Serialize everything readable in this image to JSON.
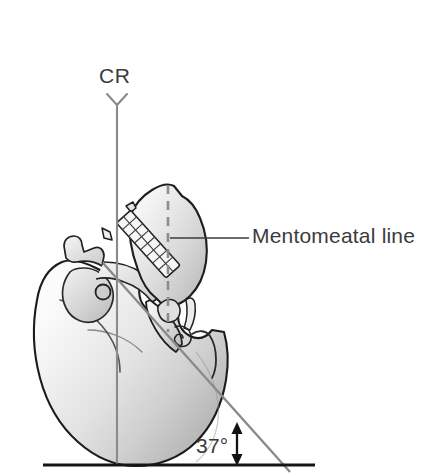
{
  "figure": {
    "name": "lateral-skull-mentomeatal-positioning-diagram",
    "labels": {
      "central_ray": "CR",
      "mentomeatal_line": "Mentomeatal line",
      "angle": "37°"
    },
    "icons": {
      "cr_arrow": "arrowhead-down-icon",
      "angle_arrow": "double-headed-arrow-icon",
      "leader_line": "leader-line-icon",
      "dashed_reference": "dashed-vertical-reference-icon"
    },
    "colors": {
      "background": "#ffffff",
      "outline": "#1a1a1a",
      "text": "#3b3b3b",
      "line_gray": "#7a7a7a",
      "baseline": "#1a1a1a",
      "dashed_gray": "#8c8c8c",
      "bone_light": "#f2f2f2",
      "bone_mid": "#d8d8d8",
      "bone_dark": "#a8a8a8",
      "tooth_fill": "#fbfbfb"
    },
    "geometry": {
      "cr_line": {
        "x": 117,
        "y_top": 103,
        "y_bottom": 466,
        "orientation": "vertical"
      },
      "cr_arrowhead": {
        "x": 117,
        "y": 95,
        "form": "Y"
      },
      "dashed_line": {
        "x": 168,
        "y_top": 185,
        "y_bottom": 332,
        "orientation": "vertical"
      },
      "mentomeatal_line": {
        "x1": 103,
        "y1": 263,
        "x2": 288,
        "y2": 470,
        "angle_degrees": 37
      },
      "baseline": {
        "x1": 43,
        "x2": 315,
        "y": 465,
        "orientation": "horizontal"
      },
      "leader_line": {
        "x1": 172,
        "x2": 250,
        "y": 238
      },
      "angle_marker": {
        "x": 237,
        "y_top": 424,
        "y_bottom": 464
      }
    }
  }
}
